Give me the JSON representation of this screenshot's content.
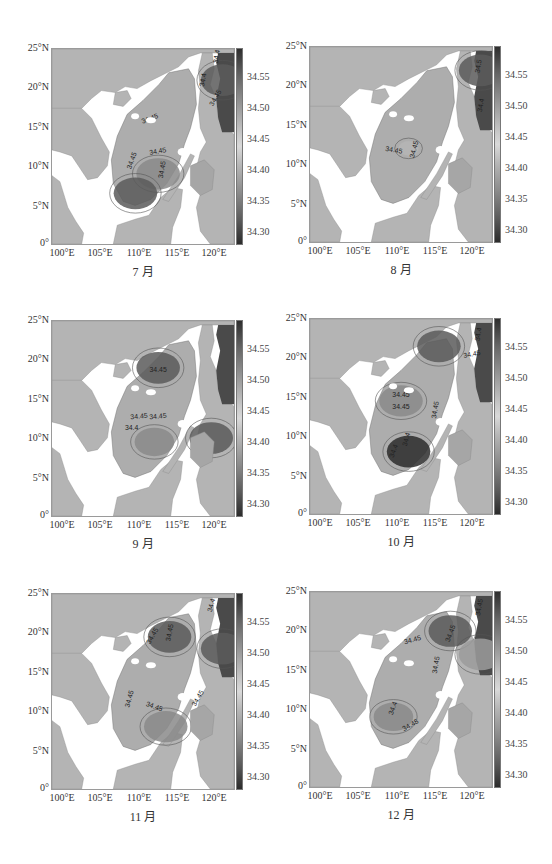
{
  "figure": {
    "panels": [
      {
        "id": "jul",
        "caption": "7 月",
        "month": 7
      },
      {
        "id": "aug",
        "caption": "8 月",
        "month": 8
      },
      {
        "id": "sep",
        "caption": "9 月",
        "month": 9
      },
      {
        "id": "oct",
        "caption": "10 月",
        "month": 10
      },
      {
        "id": "nov",
        "caption": "11 月",
        "month": 11
      },
      {
        "id": "dec",
        "caption": "12 月",
        "month": 12
      }
    ],
    "axes": {
      "lat_ticks": [
        "25°N",
        "20°N",
        "15°N",
        "10°N",
        "5°N",
        "0°"
      ],
      "lon_ticks": [
        "100°E",
        "105°E",
        "110°E",
        "115°E",
        "120°E"
      ]
    },
    "colorbar": {
      "ticks": [
        "34.55",
        "34.50",
        "34.45",
        "34.40",
        "34.35",
        "34.30"
      ]
    },
    "colors": {
      "land": "#b4b4b4",
      "no_data": "#ffffff",
      "ocean_mid": "#b0b0b0",
      "low_salinity": "#5e5e5e",
      "high_salinity": "#3a3a3a",
      "contour": "#555555"
    }
  },
  "chart_data": [
    {
      "type": "heatmap",
      "title": "7 月",
      "xlabel": "Longitude",
      "ylabel": "Latitude",
      "xlim": [
        100,
        124
      ],
      "ylim": [
        0,
        25
      ],
      "x_ticks": [
        "100°E",
        "105°E",
        "110°E",
        "115°E",
        "120°E"
      ],
      "y_ticks": [
        "0°",
        "5°N",
        "10°N",
        "15°N",
        "20°N",
        "25°N"
      ],
      "colorbar": {
        "range": [
          34.28,
          34.59
        ],
        "ticks": [
          34.3,
          34.35,
          34.4,
          34.45,
          34.5,
          34.55
        ]
      },
      "contour_labels": [
        "34.45",
        "34.45",
        "34.45",
        "34.4",
        "34.4",
        "34.45",
        "34.45"
      ],
      "features": [
        {
          "desc": "low salinity core",
          "lon": 114,
          "lat": 9,
          "approx_value": 34.38
        },
        {
          "desc": "low salinity patch",
          "lon": 111,
          "lat": 6.5,
          "approx_value": 34.36
        },
        {
          "desc": "high salinity Pacific / west of Luzon Strait",
          "lon": 122.5,
          "lat": 21,
          "approx_value": 34.55
        }
      ]
    },
    {
      "type": "heatmap",
      "title": "8 月",
      "xlim": [
        100,
        124
      ],
      "ylim": [
        0,
        25
      ],
      "colorbar": {
        "range": [
          34.28,
          34.59
        ],
        "ticks": [
          34.3,
          34.35,
          34.4,
          34.45,
          34.5,
          34.55
        ]
      },
      "contour_labels": [
        "34.45",
        "34.45",
        "34.5",
        "34.4"
      ],
      "features": [
        {
          "desc": "basin mostly uniform",
          "lon": 113,
          "lat": 12,
          "approx_value": 34.44
        },
        {
          "desc": "high salinity Pacific",
          "lon": 122.5,
          "lat": 22,
          "approx_value": 34.57
        }
      ]
    },
    {
      "type": "heatmap",
      "title": "9 月",
      "xlim": [
        100,
        124
      ],
      "ylim": [
        0,
        25
      ],
      "colorbar": {
        "range": [
          34.28,
          34.59
        ],
        "ticks": [
          34.3,
          34.35,
          34.4,
          34.45,
          34.5,
          34.55
        ]
      },
      "contour_labels": [
        "34.45",
        "34.45",
        "34.45",
        "34.4"
      ],
      "features": [
        {
          "desc": "low salinity patch",
          "lon": 114,
          "lat": 19,
          "approx_value": 34.37
        },
        {
          "desc": "low salinity south basin",
          "lon": 113.5,
          "lat": 9.5,
          "approx_value": 34.39
        },
        {
          "desc": "low salinity Sulu Sea",
          "lon": 121,
          "lat": 10,
          "approx_value": 34.33
        }
      ]
    },
    {
      "type": "heatmap",
      "title": "10 月",
      "xlim": [
        100,
        124
      ],
      "ylim": [
        0,
        25
      ],
      "colorbar": {
        "range": [
          34.28,
          34.59
        ],
        "ticks": [
          34.3,
          34.35,
          34.4,
          34.45,
          34.5,
          34.55
        ]
      },
      "contour_labels": [
        "34.45",
        "34.45",
        "34.45",
        "34.4",
        "34.4",
        "34.4",
        "34.45"
      ],
      "features": [
        {
          "desc": "strong low salinity south basin",
          "lon": 113,
          "lat": 8,
          "approx_value": 34.32
        },
        {
          "desc": "low salinity band",
          "lon": 112,
          "lat": 14.5,
          "approx_value": 34.38
        },
        {
          "desc": "low salinity north",
          "lon": 117,
          "lat": 21.5,
          "approx_value": 34.33
        }
      ]
    },
    {
      "type": "heatmap",
      "title": "11 月",
      "xlim": [
        100,
        124
      ],
      "ylim": [
        0,
        25
      ],
      "colorbar": {
        "range": [
          34.28,
          34.59
        ],
        "ticks": [
          34.3,
          34.35,
          34.4,
          34.45,
          34.5,
          34.55
        ]
      },
      "contour_labels": [
        "34.45",
        "34.45",
        "34.45",
        "34.45",
        "34.4",
        "34.45"
      ],
      "features": [
        {
          "desc": "low salinity north",
          "lon": 115.5,
          "lat": 19.5,
          "approx_value": 34.36
        },
        {
          "desc": "low salinity south",
          "lon": 115,
          "lat": 8,
          "approx_value": 34.38
        },
        {
          "desc": "high salinity Pacific",
          "lon": 122.5,
          "lat": 18,
          "approx_value": 34.55
        }
      ]
    },
    {
      "type": "heatmap",
      "title": "12 月",
      "xlim": [
        100,
        124
      ],
      "ylim": [
        0,
        25
      ],
      "colorbar": {
        "range": [
          34.28,
          34.59
        ],
        "ticks": [
          34.3,
          34.35,
          34.4,
          34.45,
          34.5,
          34.55
        ]
      },
      "contour_labels": [
        "34.45",
        "34.45",
        "34.45",
        "34.4",
        "34.45",
        "34.45"
      ],
      "features": [
        {
          "desc": "low salinity patch north-east",
          "lon": 118.5,
          "lat": 20,
          "approx_value": 34.34
        },
        {
          "desc": "low salinity south-west",
          "lon": 111,
          "lat": 9,
          "approx_value": 34.39
        },
        {
          "desc": "high salinity Pacific",
          "lon": 122.5,
          "lat": 17,
          "approx_value": 34.54
        }
      ]
    }
  ]
}
